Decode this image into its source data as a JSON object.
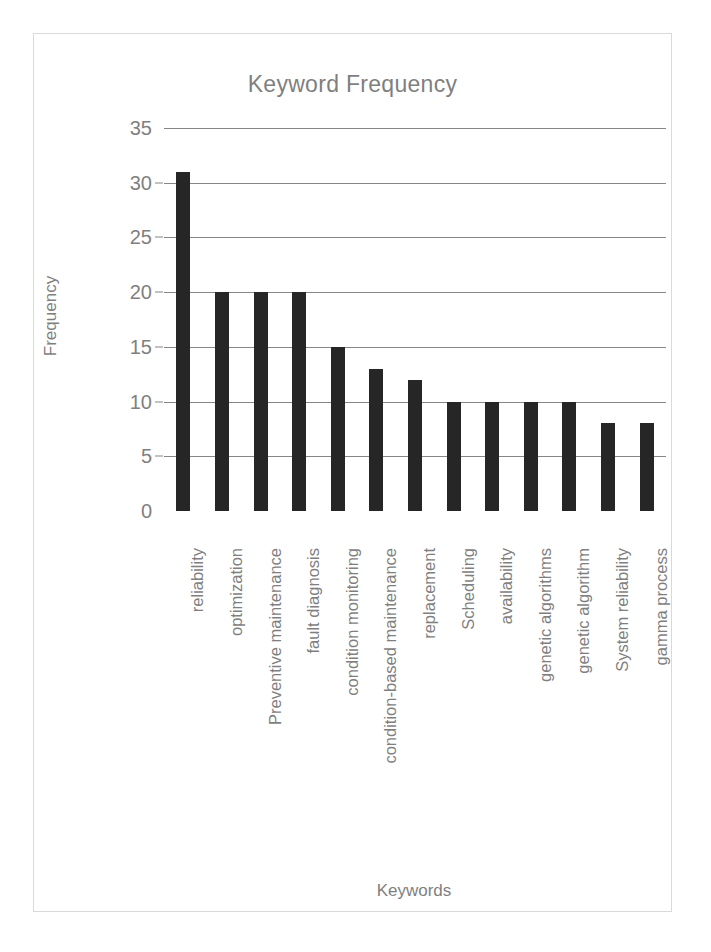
{
  "chart_data": {
    "type": "bar",
    "title": "Keyword Frequency",
    "xlabel": "Keywords",
    "ylabel": "Frequency",
    "categories": [
      "reliability",
      "optimization",
      "Preventive maintenance",
      "fault diagnosis",
      "condition monitoring",
      "condition-based maintenance",
      "replacement",
      "Scheduling",
      "availability",
      "genetic algorithms",
      "genetic algorithm",
      "System reliability",
      "gamma process"
    ],
    "values": [
      31,
      20,
      20,
      20,
      15,
      13,
      12,
      10,
      10,
      10,
      10,
      8,
      8
    ],
    "ylim": [
      0,
      35
    ],
    "yticks": [
      0,
      5,
      10,
      15,
      20,
      25,
      30,
      35
    ],
    "ytick_labels": [
      "0",
      "5",
      "10",
      "15",
      "20",
      "25",
      "30",
      "35"
    ],
    "grid": true,
    "legend": false,
    "bar_color": "#262626",
    "gridline_color": "#868686",
    "text_color": "#7f7f7f",
    "frame_color": "#d9d9d9",
    "background": "#ffffff"
  }
}
